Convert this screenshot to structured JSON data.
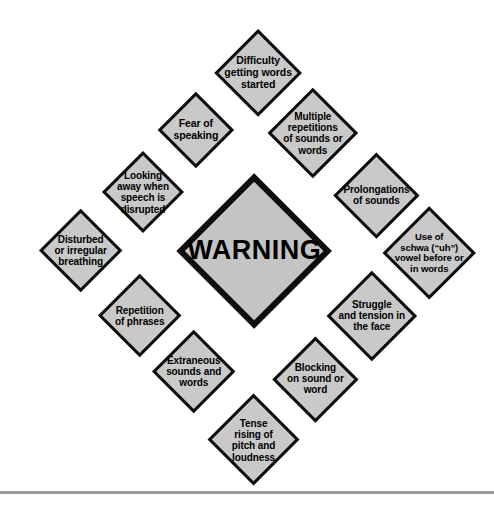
{
  "diagram": {
    "type": "radial-diamond-cluster",
    "title": "WARNING",
    "center": {
      "label": "WARNING",
      "shape": "diamond",
      "fill": "#c4c4c4",
      "stroke": "#0d0d0d",
      "cx": 254,
      "cy": 251,
      "half": 78,
      "font_size": 27
    },
    "background": "#ffffff",
    "node_fill": "#c9c9c9",
    "node_stroke": "#0d0d0d",
    "nodes": [
      {
        "id": "difficulty-getting-words-started",
        "label": "Difficulty\ngetting words\nstarted",
        "cx": 258,
        "cy": 73,
        "half": 44,
        "font_size": 10.5
      },
      {
        "id": "multiple-repetitions-of-sounds-or-words",
        "label": "Multiple\nrepetitions\nof sounds or\nwords",
        "cx": 313,
        "cy": 133,
        "half": 45,
        "font_size": 10
      },
      {
        "id": "prolongations-of-sounds",
        "label": "Prolongations\nof sounds",
        "cx": 376,
        "cy": 195,
        "half": 43,
        "font_size": 10
      },
      {
        "id": "use-of-schwa-uh-vowel-before-or-in-words",
        "label": "Use of\nschwa (“uh”)\nvowel before or\nin words",
        "cx": 429,
        "cy": 253,
        "half": 47,
        "font_size": 9.5
      },
      {
        "id": "struggle-and-tension-in-the-face",
        "label": "Struggle\nand tension in\nthe face",
        "cx": 372,
        "cy": 316,
        "half": 45,
        "font_size": 10
      },
      {
        "id": "blocking-on-sound-or-word",
        "label": "Blocking\non sound or\nword",
        "cx": 315,
        "cy": 379,
        "half": 43,
        "font_size": 10
      },
      {
        "id": "tense-rising-of-pitch-and-loudness",
        "label": "Tense\nrising of\npitch and\nloudness",
        "cx": 254,
        "cy": 440,
        "half": 46,
        "font_size": 10
      },
      {
        "id": "extraneous-sounds-and-words",
        "label": "Extraneous\nsounds and\nwords",
        "cx": 194,
        "cy": 372,
        "half": 42,
        "font_size": 10
      },
      {
        "id": "repetition-of-phrases",
        "label": "Repetition\nof phrases",
        "cx": 140,
        "cy": 316,
        "half": 42,
        "font_size": 10
      },
      {
        "id": "disturbed-or-irregular-breathing",
        "label": "Disturbed\nor irregular\nbreathing",
        "cx": 81,
        "cy": 251,
        "half": 42,
        "font_size": 10
      },
      {
        "id": "looking-away-when-speech-is-disrupted",
        "label": "Looking\naway when\nspeech is\ndisrupted",
        "cx": 143,
        "cy": 192,
        "half": 41,
        "font_size": 10
      },
      {
        "id": "fear-of-speaking",
        "label": "Fear of\nspeaking",
        "cx": 196,
        "cy": 130,
        "half": 38,
        "font_size": 10.5
      }
    ],
    "footer_rule": {
      "color": "#9b9b9b",
      "y": 491,
      "thickness": 3
    }
  }
}
